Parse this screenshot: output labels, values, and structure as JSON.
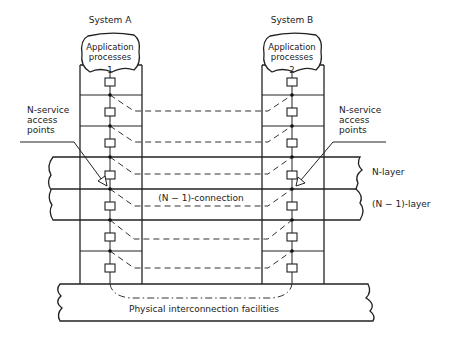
{
  "systems": [
    {
      "title": "System A",
      "app_label_line1": "Application",
      "app_label_line2": "processes",
      "app_number": "1",
      "access_label": [
        "N-service",
        "access",
        "points"
      ]
    },
    {
      "title": "System B",
      "app_label_line1": "Application",
      "app_label_line2": "processes",
      "app_number": "2",
      "access_label": [
        "N-service",
        "access",
        "points"
      ]
    }
  ],
  "layers": {
    "n_layer": "N-layer",
    "n_minus_1_layer": "(N − 1)-layer"
  },
  "connection_label": "(N − 1)-connection",
  "physical_label": "Physical interconnection facilities"
}
